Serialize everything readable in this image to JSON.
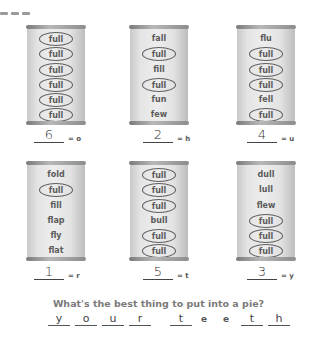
{
  "puzzle": {
    "cans": [
      {
        "words": [
          {
            "text": "full",
            "circled": true
          },
          {
            "text": "full",
            "circled": true
          },
          {
            "text": "full",
            "circled": true
          },
          {
            "text": "full",
            "circled": true
          },
          {
            "text": "full",
            "circled": true
          },
          {
            "text": "full",
            "circled": true
          }
        ],
        "answer": "6",
        "letter": "= o"
      },
      {
        "words": [
          {
            "text": "fall",
            "circled": false
          },
          {
            "text": "full",
            "circled": true
          },
          {
            "text": "fill",
            "circled": false
          },
          {
            "text": "full",
            "circled": true
          },
          {
            "text": "fun",
            "circled": false
          },
          {
            "text": "few",
            "circled": false
          }
        ],
        "answer": "2",
        "letter": "= h"
      },
      {
        "words": [
          {
            "text": "flu",
            "circled": false
          },
          {
            "text": "full",
            "circled": true
          },
          {
            "text": "full",
            "circled": true
          },
          {
            "text": "full",
            "circled": true
          },
          {
            "text": "fell",
            "circled": false
          },
          {
            "text": "full",
            "circled": true
          }
        ],
        "answer": "4",
        "letter": "= u"
      },
      {
        "words": [
          {
            "text": "fold",
            "circled": false
          },
          {
            "text": "full",
            "circled": true
          },
          {
            "text": "fill",
            "circled": false
          },
          {
            "text": "flap",
            "circled": false
          },
          {
            "text": "fly",
            "circled": false
          },
          {
            "text": "flat",
            "circled": false
          }
        ],
        "answer": "1",
        "letter": "= r"
      },
      {
        "words": [
          {
            "text": "full",
            "circled": true
          },
          {
            "text": "full",
            "circled": true
          },
          {
            "text": "full",
            "circled": true
          },
          {
            "text": "bull",
            "circled": false
          },
          {
            "text": "full",
            "circled": true
          },
          {
            "text": "full",
            "circled": true
          }
        ],
        "answer": "5",
        "letter": "= t"
      },
      {
        "words": [
          {
            "text": "dull",
            "circled": false
          },
          {
            "text": "lull",
            "circled": false
          },
          {
            "text": "flew",
            "circled": false
          },
          {
            "text": "full",
            "circled": true
          },
          {
            "text": "full",
            "circled": true
          },
          {
            "text": "full",
            "circled": true
          }
        ],
        "answer": "3",
        "letter": "= y"
      }
    ],
    "question": "What's the best thing to put into a pie?",
    "solution": [
      {
        "char": "y",
        "type": "blank"
      },
      {
        "char": "o",
        "type": "blank"
      },
      {
        "char": "u",
        "type": "blank"
      },
      {
        "char": "r",
        "type": "blank"
      },
      {
        "char": "",
        "type": "gap"
      },
      {
        "char": "t",
        "type": "blank"
      },
      {
        "char": "e",
        "type": "given"
      },
      {
        "char": "e",
        "type": "given"
      },
      {
        "char": "t",
        "type": "blank"
      },
      {
        "char": "h",
        "type": "blank"
      }
    ]
  }
}
